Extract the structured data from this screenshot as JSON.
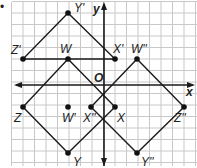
{
  "figure": {
    "bullet": "•",
    "axes": {
      "x_label": "x",
      "y_label": "y",
      "origin_label": "O"
    },
    "points": [
      {
        "name": "Y'",
        "label": "Y'",
        "px": 68,
        "py": 13,
        "lx": 74,
        "ly": 12
      },
      {
        "name": "Z'",
        "label": "Z'",
        "px": 23,
        "py": 59,
        "lx": 11,
        "ly": 54
      },
      {
        "name": "W",
        "label": "W",
        "px": 68,
        "py": 59,
        "lx": 60,
        "ly": 53
      },
      {
        "name": "X'",
        "label": "X'",
        "px": 115,
        "py": 59,
        "lx": 113,
        "ly": 53
      },
      {
        "name": "W''",
        "label": "W''",
        "px": 137,
        "py": 59,
        "lx": 131,
        "ly": 53
      },
      {
        "name": "Z",
        "label": "Z",
        "px": 23,
        "py": 107,
        "lx": 14,
        "ly": 122
      },
      {
        "name": "W'",
        "label": "W'",
        "px": 68,
        "py": 107,
        "lx": 62,
        "ly": 122
      },
      {
        "name": "X''",
        "label": "X''",
        "px": 91,
        "py": 107,
        "lx": 83,
        "ly": 122
      },
      {
        "name": "X",
        "label": "X",
        "px": 115,
        "py": 107,
        "lx": 117,
        "ly": 122
      },
      {
        "name": "Z''",
        "label": "Z''",
        "px": 184,
        "py": 107,
        "lx": 174,
        "ly": 122
      },
      {
        "name": "Y",
        "label": "Y",
        "px": 68,
        "py": 153,
        "lx": 73,
        "ly": 166
      },
      {
        "name": "Y''",
        "label": "Y''",
        "px": 137,
        "py": 153,
        "lx": 141,
        "ly": 166
      }
    ],
    "shapes": [
      {
        "name": "W'X'Y'Z'",
        "vertices": [
          "W",
          "X'",
          "Y'",
          "Z'"
        ]
      },
      {
        "name": "WXYZ",
        "vertices": [
          "W",
          "X",
          "Y",
          "Z"
        ]
      },
      {
        "name": "W''X''Y''Z''",
        "vertices": [
          "W''",
          "X''",
          "Y''",
          "Z''"
        ]
      }
    ],
    "colors": {
      "grid": "#c8c8c8",
      "lines": "#1a1a1a",
      "text": "#222222"
    }
  }
}
